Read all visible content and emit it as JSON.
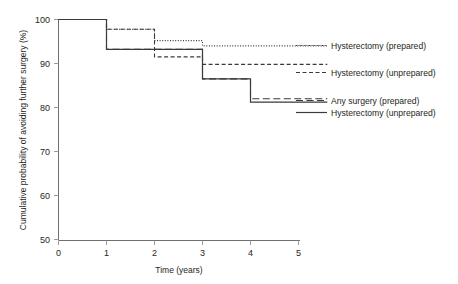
{
  "chart_data": {
    "type": "line",
    "subtype": "kaplan-meier-step",
    "title": "",
    "xlabel": "Time (years)",
    "ylabel": "Cumulative probability of avoiding further surgery (%)",
    "xlim": [
      0,
      5.6
    ],
    "ylim": [
      50,
      100
    ],
    "xticks": [
      0,
      1,
      2,
      3,
      4,
      5
    ],
    "xtick_labels": [
      "0",
      "1",
      "2",
      "3",
      "4",
      "5"
    ],
    "yticks": [
      50,
      60,
      70,
      80,
      90,
      100
    ],
    "ytick_labels": [
      "50",
      "60",
      "70",
      "80",
      "90",
      "100"
    ],
    "grid": false,
    "legend_position": "right-inside",
    "series": [
      {
        "name": "Hysterectomy (prepared)",
        "style": "dotted",
        "color": "#4a4a4a",
        "x": [
          0,
          1,
          2,
          3,
          5.6
        ],
        "y": [
          100,
          97.8,
          95.2,
          94.0,
          94.0
        ]
      },
      {
        "name": "Hysterectomy (unprepared)",
        "style": "dashed",
        "color": "#3a3a3a",
        "x": [
          0,
          1,
          2,
          3,
          5.6
        ],
        "y": [
          100,
          97.8,
          91.5,
          89.8,
          89.8
        ]
      },
      {
        "name": "Any surgery (prepared)",
        "style": "long-dash",
        "color": "#3a3a3a",
        "x": [
          0,
          1,
          2,
          3,
          4,
          5.6
        ],
        "y": [
          100,
          93.2,
          93.2,
          86.5,
          82.0,
          82.0
        ]
      },
      {
        "name": "Hysterectomy (unprepared)",
        "style": "solid",
        "color": "#2b2b2b",
        "x": [
          0,
          1,
          2,
          3,
          4,
          5.6
        ],
        "y": [
          100,
          93.2,
          93.2,
          86.5,
          81.2,
          81.2
        ]
      }
    ],
    "legend": [
      {
        "label": "Hysterectomy (prepared)",
        "style": "dotted"
      },
      {
        "label": "Hysterectomy (unprepared)",
        "style": "dashed"
      },
      {
        "label": "Any surgery (prepared)",
        "style": "long-dash"
      },
      {
        "label": "Hysterectomy (unprepared)",
        "style": "solid"
      }
    ]
  }
}
